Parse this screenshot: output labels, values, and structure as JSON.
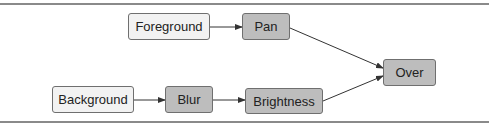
{
  "diagram": {
    "type": "flowchart",
    "nodes": [
      {
        "id": "foreground",
        "label": "Foreground",
        "kind": "source"
      },
      {
        "id": "pan",
        "label": "Pan",
        "kind": "operation"
      },
      {
        "id": "background",
        "label": "Background",
        "kind": "source"
      },
      {
        "id": "blur",
        "label": "Blur",
        "kind": "operation"
      },
      {
        "id": "brightness",
        "label": "Brightness",
        "kind": "operation"
      },
      {
        "id": "over",
        "label": "Over",
        "kind": "operation"
      }
    ],
    "edges": [
      {
        "from": "foreground",
        "to": "pan"
      },
      {
        "from": "pan",
        "to": "over"
      },
      {
        "from": "background",
        "to": "blur"
      },
      {
        "from": "blur",
        "to": "brightness"
      },
      {
        "from": "brightness",
        "to": "over"
      }
    ],
    "colors": {
      "source_fill": "#f2f2f2",
      "operation_fill": "#bdbdbd",
      "border": "#6f6f6f",
      "edge": "#333333",
      "rule": "#8a8a8a"
    }
  }
}
